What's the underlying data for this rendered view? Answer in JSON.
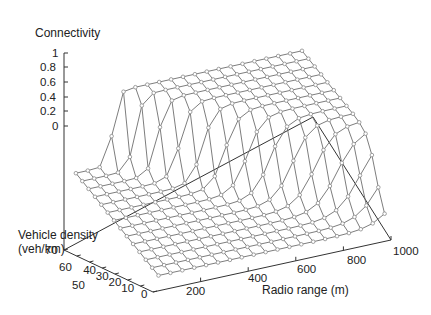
{
  "chart_data": {
    "type": "surface3d",
    "title": "",
    "zlabel": "Connectivity",
    "ylabel": "Vehicle density\n(veh/km)",
    "xlabel": "Radio range (m)",
    "zlim": [
      0,
      1
    ],
    "ylim": [
      0,
      70
    ],
    "xlim": [
      0,
      1000
    ],
    "z_ticks": [
      "1",
      "0.8",
      "0.6",
      "0.4",
      "0.2",
      "0"
    ],
    "y_ticks": [
      "70",
      "60",
      "50",
      "40",
      "30",
      "20",
      "10",
      "0"
    ],
    "x_ticks": [
      "200",
      "400",
      "600",
      "800",
      "1000"
    ],
    "grid": false,
    "x": [
      50,
      100,
      150,
      200,
      250,
      300,
      350,
      400,
      450,
      500,
      550,
      600,
      650,
      700,
      750,
      800,
      850,
      900,
      950,
      1000
    ],
    "y": [
      5,
      10,
      15,
      20,
      25,
      30,
      35,
      40,
      45,
      50,
      55,
      60,
      65,
      70
    ]
  },
  "labels": {
    "zlabel": "Connectivity",
    "ylabel_line1": "Vehicle density",
    "ylabel_line2": "(veh/km)",
    "xlabel": "Radio range (m)"
  },
  "ticks": {
    "z": [
      "1",
      "0.8",
      "0.6",
      "0.4",
      "0.2",
      "0"
    ],
    "y": [
      "70",
      "60",
      "50",
      "40",
      "30",
      "20",
      "10",
      "0"
    ],
    "x": [
      "200",
      "400",
      "600",
      "800",
      "1000"
    ]
  },
  "colors": {
    "axis": "#333333",
    "mesh": "#6e6e6e",
    "marker": "#8a8a8a"
  }
}
